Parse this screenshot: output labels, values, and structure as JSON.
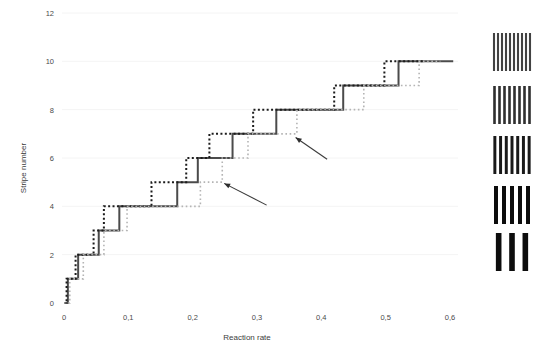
{
  "chart_data": {
    "type": "line",
    "title": "",
    "xlabel": "Reaction rate",
    "ylabel": "Stripe number",
    "xlim": [
      0,
      0.625
    ],
    "ylim": [
      0,
      12
    ],
    "xticks": [
      0,
      0.1,
      0.2,
      0.3,
      0.4,
      0.5,
      0.6
    ],
    "xtick_labels": [
      "0",
      "0,1",
      "0,2",
      "0,3",
      "0,4",
      "0,5",
      "0,6"
    ],
    "yticks": [
      0,
      2,
      4,
      6,
      8,
      10,
      12
    ],
    "ytick_labels": [
      "0",
      "2",
      "4",
      "6",
      "8",
      "10",
      "12"
    ],
    "grid": false,
    "legend": "none",
    "series": [
      {
        "name": "solid-series",
        "style": "solid",
        "color": "#4b4b4b",
        "width": 2.0,
        "step": "post",
        "points": [
          [
            0.0,
            0
          ],
          [
            0.006,
            0
          ],
          [
            0.006,
            1
          ],
          [
            0.022,
            1
          ],
          [
            0.022,
            2
          ],
          [
            0.054,
            2
          ],
          [
            0.054,
            3
          ],
          [
            0.086,
            3
          ],
          [
            0.086,
            4
          ],
          [
            0.176,
            4
          ],
          [
            0.176,
            5
          ],
          [
            0.208,
            5
          ],
          [
            0.208,
            6
          ],
          [
            0.262,
            6
          ],
          [
            0.262,
            7
          ],
          [
            0.33,
            7
          ],
          [
            0.33,
            8
          ],
          [
            0.434,
            8
          ],
          [
            0.434,
            9
          ],
          [
            0.52,
            9
          ],
          [
            0.52,
            10
          ],
          [
            0.605,
            10
          ]
        ]
      },
      {
        "name": "black-dotted-series",
        "style": "dotted",
        "color": "#1c1c1c",
        "width": 2.0,
        "step": "post",
        "points": [
          [
            0.0,
            0
          ],
          [
            0.004,
            0
          ],
          [
            0.004,
            1
          ],
          [
            0.018,
            1
          ],
          [
            0.018,
            2
          ],
          [
            0.046,
            2
          ],
          [
            0.046,
            3
          ],
          [
            0.062,
            3
          ],
          [
            0.062,
            4
          ],
          [
            0.136,
            4
          ],
          [
            0.136,
            5
          ],
          [
            0.19,
            5
          ],
          [
            0.19,
            6
          ],
          [
            0.226,
            6
          ],
          [
            0.226,
            7
          ],
          [
            0.294,
            7
          ],
          [
            0.294,
            8
          ],
          [
            0.42,
            8
          ],
          [
            0.42,
            9
          ],
          [
            0.498,
            9
          ],
          [
            0.498,
            10
          ],
          [
            0.56,
            10
          ]
        ]
      },
      {
        "name": "grey-dotted-series",
        "style": "dotted",
        "color": "#b4b4b4",
        "width": 1.6,
        "step": "post",
        "points": [
          [
            0.0,
            0
          ],
          [
            0.009,
            0
          ],
          [
            0.009,
            1
          ],
          [
            0.03,
            1
          ],
          [
            0.03,
            2
          ],
          [
            0.062,
            2
          ],
          [
            0.062,
            3
          ],
          [
            0.098,
            3
          ],
          [
            0.098,
            4
          ],
          [
            0.212,
            4
          ],
          [
            0.212,
            5
          ],
          [
            0.246,
            5
          ],
          [
            0.246,
            6
          ],
          [
            0.286,
            6
          ],
          [
            0.286,
            7
          ],
          [
            0.362,
            7
          ],
          [
            0.362,
            8
          ],
          [
            0.466,
            8
          ],
          [
            0.466,
            9
          ],
          [
            0.552,
            9
          ],
          [
            0.552,
            10
          ],
          [
            0.585,
            10
          ]
        ]
      }
    ],
    "annotations": [
      {
        "name": "arrow-lower",
        "tail": [
          0.315,
          4.05
        ],
        "head": [
          0.249,
          4.95
        ]
      },
      {
        "name": "arrow-upper",
        "tail": [
          0.409,
          5.95
        ],
        "head": [
          0.36,
          6.85
        ]
      }
    ],
    "thumbnails": [
      {
        "name": "stripe-pattern-10",
        "stripes": 10,
        "y_value": 10
      },
      {
        "name": "stripe-pattern-8",
        "stripes": 8,
        "y_value": 8
      },
      {
        "name": "stripe-pattern-7",
        "stripes": 7,
        "y_value": 6
      },
      {
        "name": "stripe-pattern-5",
        "stripes": 5,
        "y_value": 4
      },
      {
        "name": "stripe-pattern-3",
        "stripes": 3,
        "y_value": 2
      }
    ]
  },
  "axes": {
    "x_label": "Reaction rate",
    "y_label": "Stripe number"
  }
}
